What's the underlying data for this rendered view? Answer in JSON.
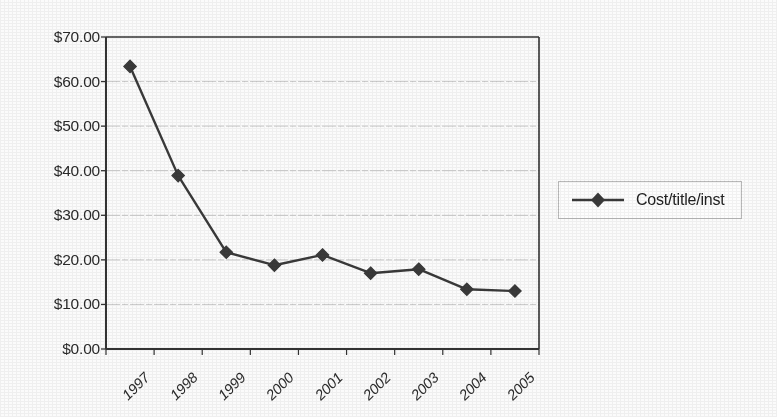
{
  "chart_data": {
    "type": "line",
    "title": "",
    "subtitle": "",
    "xlabel": "",
    "ylabel": "",
    "categories": [
      "1997",
      "1998",
      "1999",
      "2000",
      "2001",
      "2002",
      "2003",
      "2004",
      "2005"
    ],
    "series": [
      {
        "name": "Cost/title/inst",
        "values": [
          63.4,
          38.9,
          21.7,
          18.8,
          21.1,
          17.0,
          17.9,
          13.4,
          13.0
        ],
        "marker": "diamond",
        "color": "#3a3a3a"
      }
    ],
    "ylim": [
      0,
      70
    ],
    "ytick_values": [
      0,
      10,
      20,
      30,
      40,
      50,
      60,
      70
    ],
    "ytick_labels": [
      "$0.00",
      "$10.00",
      "$20.00",
      "$30.00",
      "$40.00",
      "$50.00",
      "$60.00",
      "$70.00"
    ],
    "grid": "horizontal",
    "grid_color": "#c9c9c9",
    "legend_position": "right",
    "axis_color": "#333333",
    "plot_background": "#fbfbfa",
    "xtick_rotation": "-45"
  },
  "legend": {
    "entries": [
      {
        "label": "Cost/title/inst",
        "marker_icon": "diamond-marker-icon"
      }
    ]
  }
}
